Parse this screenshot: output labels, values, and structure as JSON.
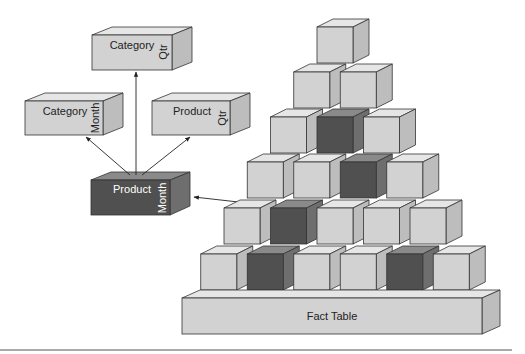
{
  "diagram": {
    "aggregates": [
      {
        "id": "category-qtr",
        "name": "Category",
        "side": "Qtr",
        "shade": "light"
      },
      {
        "id": "category-month",
        "name": "Category",
        "side": "Month",
        "shade": "light"
      },
      {
        "id": "product-qtr",
        "name": "Product",
        "side": "Qtr",
        "shade": "light"
      },
      {
        "id": "product-month",
        "name": "Product",
        "side": "Month",
        "shade": "dark"
      }
    ],
    "fact_table": {
      "label": "Fact Table"
    },
    "pyramid_rows": [
      {
        "row": 1,
        "cubes": [
          "light"
        ]
      },
      {
        "row": 2,
        "cubes": [
          "light",
          "light"
        ]
      },
      {
        "row": 3,
        "cubes": [
          "light",
          "dark",
          "light"
        ]
      },
      {
        "row": 4,
        "cubes": [
          "light",
          "light",
          "dark",
          "light"
        ]
      },
      {
        "row": 5,
        "cubes": [
          "light",
          "dark",
          "light",
          "light",
          "light"
        ]
      },
      {
        "row": 6,
        "cubes": [
          "light",
          "dark",
          "light",
          "light",
          "dark",
          "light"
        ]
      }
    ],
    "colors": {
      "light_front": "#d2d2d2",
      "light_top": "#e6e6e6",
      "light_side": "#bdbdbd",
      "dark_front": "#505050",
      "dark_top": "#8a8a8a",
      "dark_side": "#6e6e6e",
      "stroke": "#333333"
    }
  }
}
